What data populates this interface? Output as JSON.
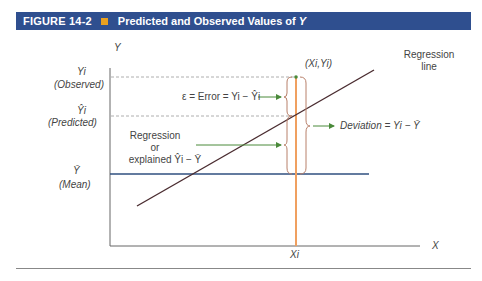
{
  "header": {
    "figure_number": "FIGURE 14-2",
    "title": "Predicted and Observed Values of ",
    "title_var": "Y",
    "accent_color": "#e8a020",
    "bar_color": "#2f4f8f"
  },
  "axes": {
    "y_label": "Y",
    "x_label": "X",
    "x_tick": "Xi"
  },
  "y_levels": {
    "observed_symbol": "Yi",
    "observed_label": "(Observed)",
    "predicted_symbol": "Ŷi",
    "predicted_label": "(Predicted)",
    "mean_symbol": "Ȳ",
    "mean_label": "(Mean)"
  },
  "annotations": {
    "point": "(Xi,Yi)",
    "regression_line_1": "Regression",
    "regression_line_2": "line",
    "error": "ε = Error = Yi − Ŷi",
    "deviation": "Deviation = Yi − Ȳ",
    "explained_1": "Regression",
    "explained_2": "or",
    "explained_3": "explained Ŷi − Ȳ"
  },
  "colors": {
    "regression_line": "#4a2c30",
    "mean_line": "#2f4f7f",
    "xi_line": "#f0a060",
    "arrows": "#4a8a3a",
    "braces": "#b8806a"
  }
}
